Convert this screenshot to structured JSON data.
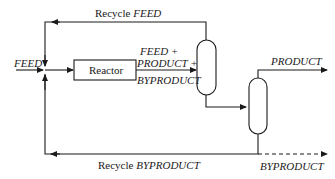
{
  "diagram": {
    "colors": {
      "line": "#1a1a1a",
      "background": "#ffffff"
    },
    "labels": {
      "feed": "FEED",
      "reactor": "Reactor",
      "recycle_feed_prefix": "Recycle ",
      "recycle_feed_stream": "FEED",
      "mix_line1": "FEED +",
      "mix_line2": "PRODUCT +",
      "mix_line3": "BYPRODUCT",
      "product": "PRODUCT",
      "recycle_byproduct_prefix": "Recycle ",
      "recycle_byproduct_stream": "BYPRODUCT",
      "byproduct": "BYPRODUCT"
    },
    "nodes": [
      {
        "id": "reactor",
        "type": "box",
        "label": "Reactor"
      },
      {
        "id": "separator-1",
        "type": "vessel"
      },
      {
        "id": "separator-2",
        "type": "vessel"
      }
    ],
    "edges": [
      {
        "from": "feed-in",
        "to": "mixer",
        "label": "FEED"
      },
      {
        "from": "mixer",
        "to": "reactor"
      },
      {
        "from": "reactor",
        "to": "separator-1",
        "label": "FEED + PRODUCT + BYPRODUCT"
      },
      {
        "from": "separator-1",
        "to": "mixer",
        "label": "Recycle FEED"
      },
      {
        "from": "separator-1",
        "to": "separator-2"
      },
      {
        "from": "separator-2",
        "to": "product-out",
        "label": "PRODUCT"
      },
      {
        "from": "separator-2",
        "to": "mixer",
        "label": "Recycle BYPRODUCT"
      },
      {
        "from": "separator-2",
        "to": "byproduct-out",
        "label": "BYPRODUCT",
        "style": "dashed"
      }
    ]
  }
}
